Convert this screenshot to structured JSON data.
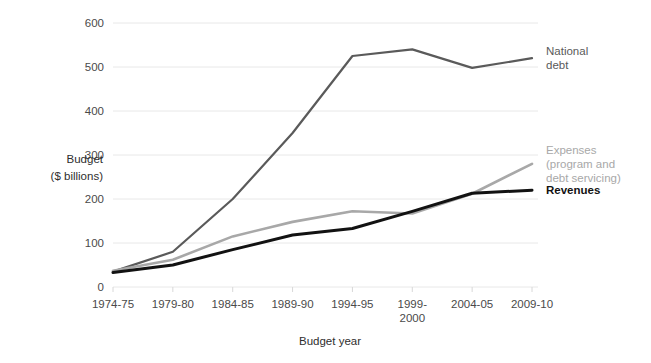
{
  "chart_data": {
    "type": "line",
    "title": "",
    "xlabel": "Budget year",
    "ylabel": "Budget ($ billions)",
    "ylabel_line1": "Budget",
    "ylabel_line2": "($ billions)",
    "categories": [
      "1974-75",
      "1979-80",
      "1984-85",
      "1989-90",
      "1994-95",
      "1999-2000",
      "2004-05",
      "2009-10"
    ],
    "category_lines": [
      [
        "1974-75"
      ],
      [
        "1979-80"
      ],
      [
        "1984-85"
      ],
      [
        "1989-90"
      ],
      [
        "1994-95"
      ],
      [
        "1999-",
        "2000"
      ],
      [
        "2004-05"
      ],
      [
        "2009-10"
      ]
    ],
    "ylim": [
      0,
      600
    ],
    "yticks": [
      0,
      100,
      200,
      300,
      400,
      500,
      600
    ],
    "ytick_labels": [
      "0",
      "100",
      "200",
      "300",
      "400",
      "500",
      "600"
    ],
    "grid": true,
    "legend_position": "right-inline",
    "series": [
      {
        "name": "National debt",
        "label_lines": [
          "National",
          "debt"
        ],
        "color": "#5a5a5a",
        "width": 2.2,
        "bold": false,
        "values": [
          35,
          80,
          200,
          350,
          525,
          540,
          498,
          520
        ]
      },
      {
        "name": "Expenses (program and debt servicing)",
        "label_lines": [
          "Expenses",
          "(program and",
          "debt servicing)"
        ],
        "color": "#a8a8a8",
        "width": 2.6,
        "bold": false,
        "values": [
          37,
          62,
          115,
          148,
          172,
          167,
          212,
          280
        ]
      },
      {
        "name": "Revenues",
        "label_lines": [
          "Revenues"
        ],
        "color": "#121212",
        "width": 3.0,
        "bold": true,
        "values": [
          33,
          50,
          85,
          118,
          133,
          172,
          213,
          220
        ]
      }
    ]
  },
  "colors": {
    "background": "#ffffff",
    "gridline": "#e8e8e8",
    "tick_text": "#4a4a4a",
    "axis_title": "#2e2e2e",
    "national_debt": "#5a5a5a",
    "expenses": "#a8a8a8",
    "revenues": "#121212"
  }
}
